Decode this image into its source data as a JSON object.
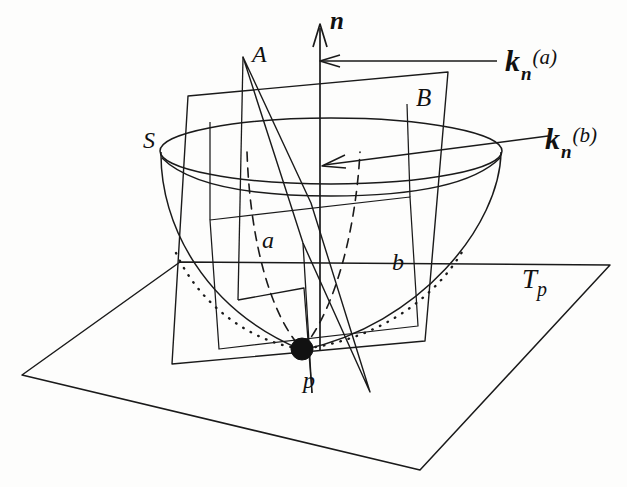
{
  "figure": {
    "background_color": "#fdfdfc",
    "ink_color": "#111111",
    "width": 627,
    "height": 487
  },
  "labels": {
    "normal_vector": "n",
    "plane_a": "A",
    "plane_b": "B",
    "surface": "S",
    "curve_a": "a",
    "curve_b": "b",
    "point": "p",
    "tangent_plane_letter": "T",
    "tangent_plane_sub": "p",
    "kn_a": {
      "base": "k",
      "sub": "n",
      "sup": "(a)"
    },
    "kn_b": {
      "base": "k",
      "sub": "n",
      "sup": "(b)"
    }
  },
  "elements": {
    "surface_name": "paraboloid-surface-S",
    "rim_name": "surface-rim-ellipse",
    "normal_arrow_name": "normal-vector-arrow",
    "tangent_plane_name": "tangent-plane-Tp",
    "plane_a_name": "normal-plane-A",
    "plane_b_name": "normal-plane-B",
    "curve_a_name": "normal-section-curve-a",
    "curve_b_name": "normal-section-curve-b",
    "point_name": "point-p-marker",
    "leader_a_name": "leader-line-kn-a",
    "leader_b_name": "leader-line-kn-b"
  }
}
